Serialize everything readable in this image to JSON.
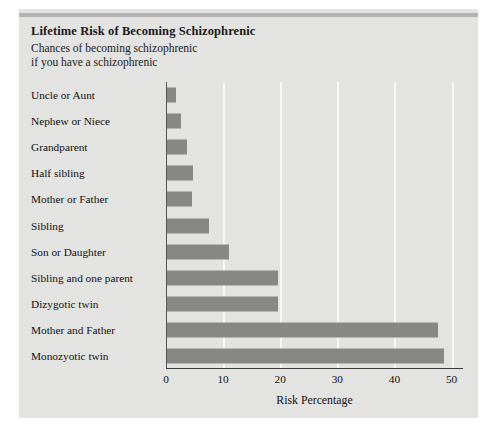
{
  "figure": {
    "title": "Lifetime Risk of Becoming Schizophrenic",
    "subtitle": "Chances of becoming schizophrenic\nif you have a schizophrenic",
    "bar_color": "#878784",
    "panel_color": "#e3e3e1",
    "gridline_color": "#f7f7f6"
  },
  "chart_data": {
    "type": "bar",
    "orientation": "horizontal",
    "title": "Lifetime Risk of Becoming Schizophrenic",
    "subtitle": "Chances of becoming schizophrenic if you have a schizophrenic",
    "xlabel": "Risk Percentage",
    "ylabel": "",
    "xlim": [
      0,
      52
    ],
    "xticks": [
      0,
      10,
      20,
      30,
      40,
      50
    ],
    "xticklabels": [
      "0",
      "10",
      "20",
      "30",
      "40",
      "50"
    ],
    "grid": "vertical-only",
    "legend": "none",
    "categories": [
      "Uncle or Aunt",
      "Nephew or Niece",
      "Grandparent",
      "Half sibling",
      "Mother or Father",
      "Sibling",
      "Son or Daughter",
      "Sibling and one parent",
      "Dizygotic twin",
      "Mother and Father",
      "Monozyotic twin"
    ],
    "values": [
      1.5,
      2.5,
      3.5,
      4.5,
      4.3,
      7.3,
      10.8,
      19.5,
      19.5,
      47.5,
      48.5
    ]
  }
}
